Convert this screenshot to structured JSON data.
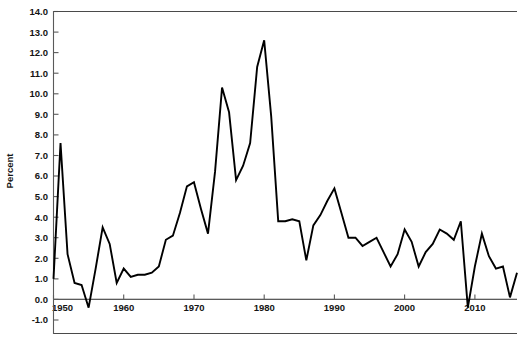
{
  "chart_data": {
    "type": "line",
    "title": "",
    "subtitle": "",
    "xlabel": "",
    "ylabel": "Percent",
    "ylim": [
      -1.0,
      14.0
    ],
    "xlim": [
      1950,
      2016
    ],
    "ytick_step": 1.0,
    "yticks": [
      14.0,
      13.0,
      12.0,
      11.0,
      10.0,
      9.0,
      8.0,
      7.0,
      6.0,
      5.0,
      4.0,
      3.0,
      2.0,
      1.0,
      0.0,
      -1.0
    ],
    "ytick_labels": [
      "14.0",
      "13.0",
      "12.0",
      "11.0",
      "10.0",
      "9.0",
      "8.0",
      "7.0",
      "6.0",
      "5.0",
      "4.0",
      "3.0",
      "2.0",
      "1.0",
      "0.0",
      "-1.0"
    ],
    "xticks": [
      1950,
      1960,
      1970,
      1980,
      1990,
      2000,
      2010
    ],
    "xtick_labels": [
      "1950",
      "1960",
      "1970",
      "1980",
      "1990",
      "2000",
      "2010"
    ],
    "grid": false,
    "legend": null,
    "legend_position": "none",
    "line_color": "#000000",
    "series": [
      {
        "name": "Percent",
        "x": [
          1950,
          1951,
          1952,
          1953,
          1954,
          1955,
          1956,
          1957,
          1958,
          1959,
          1960,
          1961,
          1962,
          1963,
          1964,
          1965,
          1966,
          1967,
          1968,
          1969,
          1970,
          1971,
          1972,
          1973,
          1974,
          1975,
          1976,
          1977,
          1978,
          1979,
          1980,
          1981,
          1982,
          1983,
          1984,
          1985,
          1986,
          1987,
          1988,
          1989,
          1990,
          1991,
          1992,
          1993,
          1994,
          1995,
          1996,
          1997,
          1998,
          1999,
          2000,
          2001,
          2002,
          2003,
          2004,
          2005,
          2006,
          2007,
          2008,
          2009,
          2010,
          2011,
          2012,
          2013,
          2014,
          2015,
          2016
        ],
        "values": [
          1.0,
          7.6,
          2.2,
          0.8,
          0.7,
          -0.4,
          1.5,
          3.5,
          2.7,
          0.8,
          1.5,
          1.1,
          1.2,
          1.2,
          1.3,
          1.6,
          2.9,
          3.1,
          4.2,
          5.5,
          5.7,
          4.4,
          3.2,
          6.2,
          10.3,
          9.1,
          5.8,
          6.5,
          7.6,
          11.3,
          12.6,
          8.9,
          3.8,
          3.8,
          3.9,
          3.8,
          1.9,
          3.6,
          4.1,
          4.8,
          5.4,
          4.2,
          3.0,
          3.0,
          2.6,
          2.8,
          3.0,
          2.3,
          1.6,
          2.2,
          3.4,
          2.8,
          1.6,
          2.3,
          2.7,
          3.4,
          3.2,
          2.9,
          3.8,
          -0.4,
          1.6,
          3.2,
          2.1,
          1.5,
          1.6,
          0.1,
          1.3
        ]
      }
    ]
  },
  "axis": {
    "ylabel": "Percent"
  }
}
